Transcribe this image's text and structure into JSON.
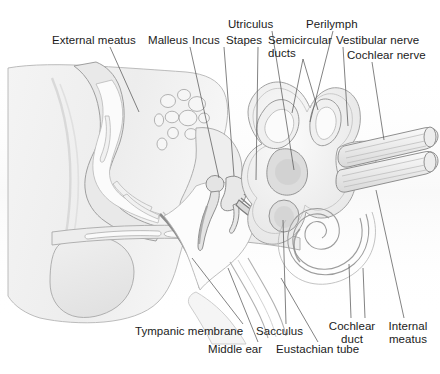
{
  "figure": {
    "width": 440,
    "height": 374,
    "background": "#ffffff",
    "ink": "#1b1b1b",
    "leader_color": "#5a5a5a",
    "outline_color": "#9a9a9a",
    "fill_light": "#f2f2f2",
    "fill_mid": "#e6e6e6",
    "fill_dark": "#d8d8d8"
  },
  "labels": {
    "external_meatus": "External meatus",
    "malleus": "Malleus",
    "incus": "Incus",
    "stapes": "Stapes",
    "utriculus": "Utriculus",
    "semicircular_ducts_line1": "Semicircular",
    "semicircular_ducts_line2": "ducts",
    "perilymph": "Perilymph",
    "vestibular_nerve": "Vestibular nerve",
    "cochlear_nerve": "Cochlear nerve",
    "tympanic_membrane": "Tympanic membrane",
    "middle_ear": "Middle ear",
    "sacculus": "Sacculus",
    "eustachian_tube": "Eustachian tube",
    "cochlear_duct_line1": "Cochlear",
    "cochlear_duct_line2": "duct",
    "internal_meatus_line1": "Internal",
    "internal_meatus_line2": "meatus"
  },
  "structures": [
    {
      "name": "external-meatus",
      "label": "External meatus",
      "group": "outer-ear"
    },
    {
      "name": "malleus",
      "label": "Malleus",
      "group": "ossicles"
    },
    {
      "name": "incus",
      "label": "Incus",
      "group": "ossicles"
    },
    {
      "name": "stapes",
      "label": "Stapes",
      "group": "ossicles"
    },
    {
      "name": "utriculus",
      "label": "Utriculus",
      "group": "inner-ear"
    },
    {
      "name": "semicircular-ducts",
      "label": "Semicircular ducts",
      "group": "inner-ear"
    },
    {
      "name": "perilymph",
      "label": "Perilymph",
      "group": "inner-ear"
    },
    {
      "name": "vestibular-nerve",
      "label": "Vestibular nerve",
      "group": "nerves"
    },
    {
      "name": "cochlear-nerve",
      "label": "Cochlear nerve",
      "group": "nerves"
    },
    {
      "name": "tympanic-membrane",
      "label": "Tympanic membrane",
      "group": "middle-ear"
    },
    {
      "name": "middle-ear",
      "label": "Middle ear",
      "group": "middle-ear"
    },
    {
      "name": "sacculus",
      "label": "Sacculus",
      "group": "inner-ear"
    },
    {
      "name": "eustachian-tube",
      "label": "Eustachian tube",
      "group": "middle-ear"
    },
    {
      "name": "cochlear-duct",
      "label": "Cochlear duct",
      "group": "inner-ear"
    },
    {
      "name": "internal-meatus",
      "label": "Internal meatus",
      "group": "inner-ear"
    }
  ]
}
